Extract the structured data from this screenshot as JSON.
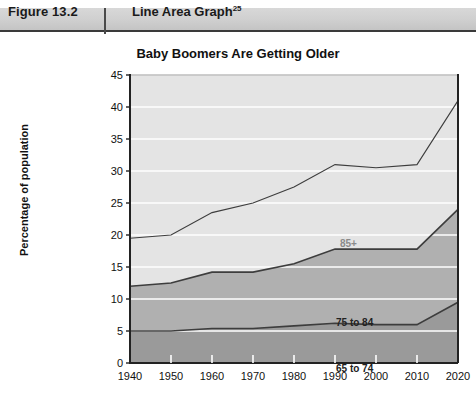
{
  "figure": {
    "label": "Figure 13.2",
    "title": "Line Area Graph",
    "superscript": "25"
  },
  "chart_data": {
    "type": "area",
    "stacked": true,
    "title": "Baby Boomers Are Getting Older",
    "xlabel": "",
    "ylabel": "Percentage of population",
    "categories": [
      "1940",
      "1950",
      "1960",
      "1970",
      "1980",
      "1990",
      "2000",
      "2010",
      "2020"
    ],
    "x": [
      1940,
      1950,
      1960,
      1970,
      1980,
      1990,
      2000,
      2010,
      2020
    ],
    "ylim": [
      0,
      45
    ],
    "ytick_step": 5,
    "yticks": [
      "0",
      "5",
      "10",
      "15",
      "20",
      "25",
      "30",
      "35",
      "40",
      "45"
    ],
    "grid": true,
    "grid_color": "#ffffff",
    "legend_position": "inline",
    "series": [
      {
        "name": "65 to 74",
        "label": "65 to 74",
        "color": "#9a9a9a",
        "values": [
          5.0,
          5.0,
          5.4,
          5.4,
          5.8,
          6.2,
          6.0,
          6.0,
          9.5
        ]
      },
      {
        "name": "75 to 84",
        "label": "75 to 84",
        "color": "#b0b0b0",
        "values": [
          7.0,
          7.5,
          8.8,
          8.8,
          9.7,
          11.6,
          11.8,
          11.8,
          14.5
        ]
      },
      {
        "name": "85+",
        "label": "85+",
        "color": "#e4e4e4",
        "values": [
          7.5,
          7.5,
          9.3,
          10.8,
          12.0,
          13.2,
          12.7,
          13.2,
          17.0
        ]
      }
    ],
    "cumulative_totals": [
      19.5,
      20.0,
      23.5,
      25.0,
      27.5,
      31.0,
      30.5,
      31.0,
      41.0
    ],
    "cumulative_lower_mid": [
      12.0,
      12.5,
      14.2,
      14.2,
      15.5,
      17.8,
      17.8,
      17.8,
      24.0
    ]
  },
  "colors": {
    "band_top": "#e4e4e4",
    "band_mid": "#b0b0b0",
    "band_bottom": "#9a9a9a",
    "line": "#3d3d3d",
    "axis": "#222222",
    "header_band": "#cfcfcf"
  }
}
